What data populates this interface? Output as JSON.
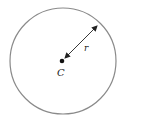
{
  "diagram": {
    "center_label": "C",
    "radius_label": "r",
    "circle_color": "#8a8a8a",
    "line_color": "#222222"
  }
}
